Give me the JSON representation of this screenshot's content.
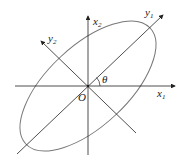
{
  "diagram": {
    "type": "rotated-coordinate-axes-with-ellipse",
    "labels": {
      "x1": {
        "base": "x",
        "sub": "1"
      },
      "x2": {
        "base": "x",
        "sub": "2"
      },
      "y1": {
        "base": "y",
        "sub": "1"
      },
      "y2": {
        "base": "y",
        "sub": "2"
      },
      "origin": "O",
      "angle": "θ"
    },
    "colors": {
      "axes": "#222222",
      "ellipse": "#777777"
    }
  }
}
